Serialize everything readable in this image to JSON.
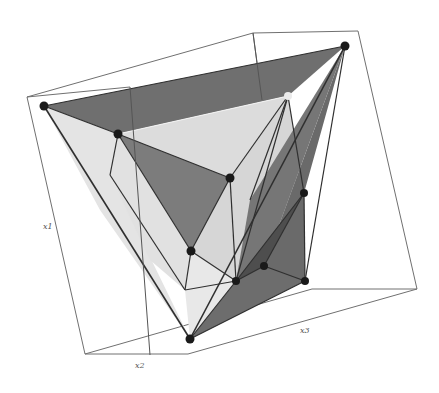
{
  "figure": {
    "type": "3d-polytope",
    "colors": {
      "background": "#ffffff",
      "box_edge": "#6a6a6a",
      "edge": "#333333",
      "vertex": "#1a1a1a",
      "vertex_light": "#e8e8e8",
      "face_dark": "#6e6e6e",
      "face_mid": "#8a8a8a",
      "face_light": "#d9d9d9",
      "face_lighter": "#e6e6e6",
      "face_darkest": "#555555"
    }
  },
  "axes": {
    "x1": {
      "label": "x1"
    },
    "x2": {
      "label": "x2"
    },
    "x3": {
      "label": "x3"
    }
  },
  "bounding_box": {
    "corners": [
      [
        27,
        97
      ],
      [
        253,
        33
      ],
      [
        358,
        31
      ],
      [
        417,
        289
      ],
      [
        312,
        289
      ],
      [
        85,
        354
      ],
      [
        188,
        354
      ],
      [
        108,
        78
      ]
    ]
  },
  "vertices": [
    {
      "id": "v1",
      "x": 44,
      "y": 106,
      "shade": "dark"
    },
    {
      "id": "v2",
      "x": 345,
      "y": 46,
      "shade": "dark"
    },
    {
      "id": "v3",
      "x": 118,
      "y": 134,
      "shade": "dark"
    },
    {
      "id": "v4",
      "x": 288,
      "y": 96,
      "shade": "light"
    },
    {
      "id": "v5",
      "x": 230,
      "y": 178,
      "shade": "dark"
    },
    {
      "id": "v6",
      "x": 191,
      "y": 251,
      "shade": "dark"
    },
    {
      "id": "v7",
      "x": 304,
      "y": 193,
      "shade": "dark"
    },
    {
      "id": "v8",
      "x": 236,
      "y": 281,
      "shade": "dark"
    },
    {
      "id": "v9",
      "x": 264,
      "y": 266,
      "shade": "dark"
    },
    {
      "id": "v10",
      "x": 305,
      "y": 281,
      "shade": "dark"
    },
    {
      "id": "v11",
      "x": 190,
      "y": 339,
      "shade": "dark"
    }
  ]
}
